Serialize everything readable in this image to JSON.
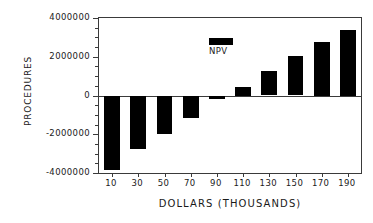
{
  "chart_data": {
    "type": "bar",
    "title": "",
    "xlabel": "DOLLARS (THOUSANDS)",
    "ylabel": "PROCEDURES",
    "categories": [
      "10",
      "30",
      "50",
      "70",
      "90",
      "110",
      "130",
      "150",
      "170",
      "190"
    ],
    "series": [
      {
        "name": "NPV",
        "color": "#000000",
        "values": [
          -3850000,
          -2750000,
          -2000000,
          -1150000,
          -200000,
          450000,
          1270000,
          2030000,
          2750000,
          3400000
        ]
      }
    ],
    "ylim": [
      -4000000,
      4000000
    ],
    "ytick_labels": [
      "4000000",
      "2000000",
      "0",
      "-2000000",
      "-4000000"
    ],
    "ytick_values": [
      4000000,
      2000000,
      0,
      -2000000,
      -4000000
    ],
    "yminor_step": 500000,
    "grid": false,
    "legend": {
      "position": "top-left-inside",
      "entries": [
        {
          "label": "NPV",
          "color": "#000000"
        }
      ]
    },
    "axis_color": "#3a3a3a",
    "background": "#ffffff"
  }
}
